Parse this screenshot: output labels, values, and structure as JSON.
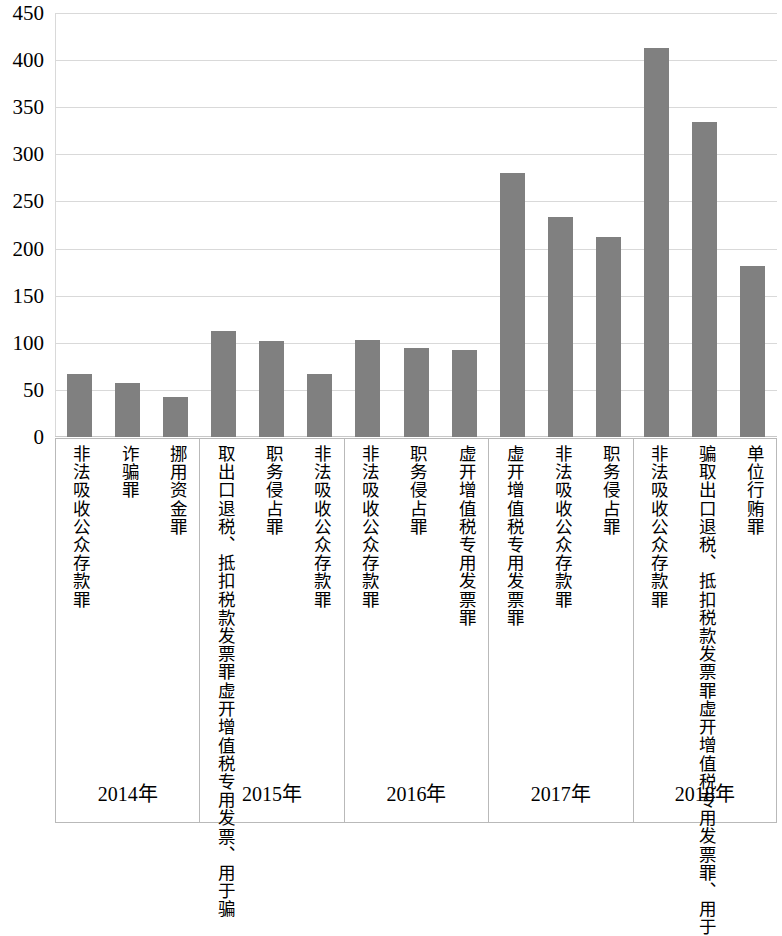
{
  "chart_data": {
    "type": "bar",
    "title": "",
    "subtitle": "",
    "xlabel": "",
    "ylabel": "",
    "ylim": [
      0,
      450
    ],
    "ytick_step": 50,
    "yticks": [
      450,
      400,
      350,
      300,
      250,
      200,
      150,
      100,
      50,
      0
    ],
    "grid": true,
    "legend": null,
    "bar_color": "#808080",
    "gridline_color": "#d9d9d9",
    "group_border_color": "#b9b9b9",
    "groups": [
      {
        "year": "2014年",
        "categories": [
          {
            "label_lines": [
              "非法吸收公众存款罪"
            ],
            "value": 67
          },
          {
            "label_lines": [
              "诈骗罪"
            ],
            "value": 57
          },
          {
            "label_lines": [
              "挪用资金罪"
            ],
            "value": 43
          }
        ]
      },
      {
        "year": "2015年",
        "categories": [
          {
            "label_lines": [
              "虚开增值税专用发票、用于骗",
              "取出口退税、抵扣税款发票罪"
            ],
            "value": 112
          },
          {
            "label_lines": [
              "职务侵占罪"
            ],
            "value": 102
          },
          {
            "label_lines": [
              "非法吸收公众存款罪"
            ],
            "value": 67
          }
        ]
      },
      {
        "year": "2016年",
        "categories": [
          {
            "label_lines": [
              "非法吸收公众存款罪"
            ],
            "value": 103
          },
          {
            "label_lines": [
              "职务侵占罪"
            ],
            "value": 95
          },
          {
            "label_lines": [
              "虚开增值税专用发票罪"
            ],
            "value": 92
          }
        ]
      },
      {
        "year": "2017年",
        "categories": [
          {
            "label_lines": [
              "虚开增值税专用发票罪"
            ],
            "value": 280
          },
          {
            "label_lines": [
              "非法吸收公众存款罪"
            ],
            "value": 233
          },
          {
            "label_lines": [
              "职务侵占罪"
            ],
            "value": 212
          }
        ]
      },
      {
        "year": "2018年",
        "categories": [
          {
            "label_lines": [
              "非法吸收公众存款罪"
            ],
            "value": 413
          },
          {
            "label_lines": [
              "虚开增值税专用发票罪、用于",
              "骗取出口退税、抵扣税款发票罪"
            ],
            "value": 334
          },
          {
            "label_lines": [
              "单位行贿罪"
            ],
            "value": 182
          }
        ]
      }
    ],
    "categories": [
      "非法吸收公众存款罪",
      "诈骗罪",
      "挪用资金罪",
      "虚开增值税专用发票、用于骗取出口退税、抵扣税款发票罪",
      "职务侵占罪",
      "非法吸收公众存款罪",
      "非法吸收公众存款罪",
      "职务侵占罪",
      "虚开增值税专用发票罪",
      "虚开增值税专用发票罪",
      "非法吸收公众存款罪",
      "职务侵占罪",
      "非法吸收公众存款罪",
      "虚开增值税专用发票罪、用于骗取出口退税、抵扣税款发票罪",
      "单位行贿罪"
    ],
    "values": [
      67,
      57,
      43,
      112,
      102,
      67,
      103,
      95,
      92,
      280,
      233,
      212,
      413,
      334,
      182
    ]
  }
}
